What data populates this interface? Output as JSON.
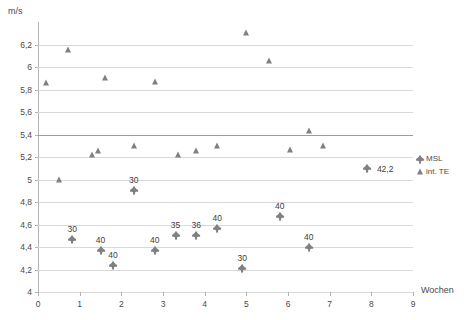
{
  "chart_data": {
    "type": "scatter",
    "title": "",
    "xlabel": "Wochen",
    "ylabel": "m/s",
    "xlim": [
      0,
      9
    ],
    "ylim": [
      4,
      6.4
    ],
    "xticks": [
      "0",
      "1",
      "2",
      "3",
      "4",
      "5",
      "6",
      "7",
      "8",
      "9"
    ],
    "xtick_values": [
      0,
      1,
      2,
      3,
      4,
      5,
      6,
      7,
      8,
      9
    ],
    "yticks": [
      "4",
      "4,2",
      "4,4",
      "4,6",
      "4,8",
      "5",
      "5,2",
      "5,4",
      "5,6",
      "5,8",
      "6",
      "6,2"
    ],
    "ytick_values": [
      4,
      4.2,
      4.4,
      4.6,
      4.8,
      5,
      5.2,
      5.4,
      5.6,
      5.8,
      6,
      6.2
    ],
    "grid": true,
    "grid_axis": "y",
    "major_gridline": 5.4,
    "legend_position": "right",
    "marker_color": "#808080",
    "gridline_color": "#d9d9d9",
    "series": [
      {
        "name": "MSL",
        "marker": "diamond",
        "points": [
          {
            "x": 0.82,
            "y": 4.47,
            "label": "30"
          },
          {
            "x": 1.5,
            "y": 4.37,
            "label": "40"
          },
          {
            "x": 1.8,
            "y": 4.24,
            "label": "40"
          },
          {
            "x": 2.3,
            "y": 4.91,
            "label": "30"
          },
          {
            "x": 2.8,
            "y": 4.37,
            "label": "40"
          },
          {
            "x": 3.3,
            "y": 4.51,
            "label": "35"
          },
          {
            "x": 3.8,
            "y": 4.51,
            "label": "36"
          },
          {
            "x": 4.3,
            "y": 4.57,
            "label": "40"
          },
          {
            "x": 4.9,
            "y": 4.21,
            "label": "30"
          },
          {
            "x": 5.8,
            "y": 4.68,
            "label": "40"
          },
          {
            "x": 6.5,
            "y": 4.4,
            "label": "40"
          },
          {
            "x": 7.9,
            "y": 5.1,
            "label": "42,2"
          }
        ]
      },
      {
        "name": "int. TE",
        "marker": "triangle",
        "points": [
          {
            "x": 0.18,
            "y": 5.86,
            "label": ""
          },
          {
            "x": 0.5,
            "y": 5.0,
            "label": ""
          },
          {
            "x": 0.72,
            "y": 6.15,
            "label": ""
          },
          {
            "x": 1.3,
            "y": 5.22,
            "label": ""
          },
          {
            "x": 1.45,
            "y": 5.25,
            "label": ""
          },
          {
            "x": 1.6,
            "y": 5.9,
            "label": ""
          },
          {
            "x": 2.3,
            "y": 5.3,
            "label": ""
          },
          {
            "x": 2.8,
            "y": 5.87,
            "label": ""
          },
          {
            "x": 3.35,
            "y": 5.22,
            "label": ""
          },
          {
            "x": 3.8,
            "y": 5.25,
            "label": ""
          },
          {
            "x": 4.3,
            "y": 5.3,
            "label": ""
          },
          {
            "x": 5.0,
            "y": 6.3,
            "label": ""
          },
          {
            "x": 5.55,
            "y": 6.05,
            "label": ""
          },
          {
            "x": 6.05,
            "y": 5.26,
            "label": ""
          },
          {
            "x": 6.5,
            "y": 5.43,
            "label": ""
          },
          {
            "x": 6.85,
            "y": 5.3,
            "label": ""
          }
        ]
      }
    ]
  },
  "legend": {
    "items": [
      {
        "label": "MSL",
        "marker": "diamond"
      },
      {
        "label": "int. TE",
        "marker": "triangle"
      }
    ]
  }
}
